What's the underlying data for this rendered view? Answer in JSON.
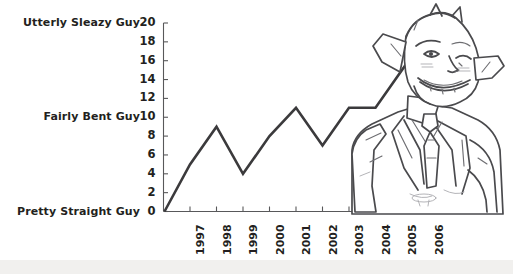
{
  "chart_data": {
    "type": "line",
    "title": "",
    "xlabel": "",
    "ylabel": "",
    "ylim": [
      0,
      20
    ],
    "grid": false,
    "legend": "none",
    "categories": [
      "1997",
      "1998",
      "1999",
      "2000",
      "2001",
      "2002",
      "2003",
      "2004",
      "2005",
      "2006"
    ],
    "values": [
      5,
      9,
      4,
      8,
      11,
      7,
      11,
      11,
      15,
      19
    ],
    "origin_value": 0,
    "y_ticks": [
      0,
      2,
      4,
      6,
      8,
      10,
      12,
      14,
      16,
      18,
      20
    ],
    "y_tick_labels": [
      "0",
      "2",
      "4",
      "6",
      "8",
      "10",
      "12",
      "14",
      "16",
      "18",
      "20"
    ],
    "y_annotations": [
      {
        "value": 20,
        "label": "Utterly Sleazy Guy"
      },
      {
        "value": 10,
        "label": "Fairly Bent Guy"
      },
      {
        "value": 0,
        "label": "Pretty Straight Guy"
      }
    ],
    "series_color": "#3b3a3c",
    "axis_color": "#58585a",
    "background": "#ffffff"
  },
  "illustration": {
    "name": "sleazy-businessman-caricature",
    "description": "Line-art caricature of a grinning winking man with pointed ears wearing a suit and tie"
  },
  "footer": {
    "strip_color": "#f1f0ee"
  }
}
